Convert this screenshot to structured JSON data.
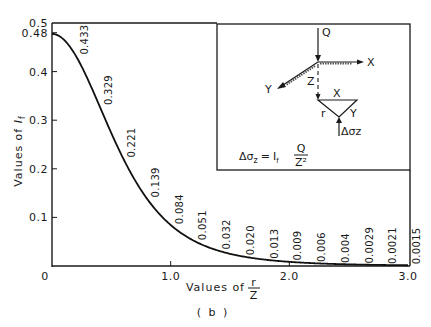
{
  "chart_data": {
    "type": "line",
    "title": "",
    "caption": "( b )",
    "xlabel": "Values of r/Z",
    "xlabel_prefix": "Values of",
    "xlabel_fraction": {
      "num": "r",
      "den": "Z"
    },
    "ylabel": "Values of If",
    "ylabel_prefix": "Values of",
    "ylabel_symbol": "I",
    "ylabel_subscript": "f",
    "xlim": [
      0,
      3.0
    ],
    "ylim": [
      0,
      0.5
    ],
    "grid": false,
    "legend": null,
    "x_ticks": [
      {
        "value": 0,
        "label": "0"
      },
      {
        "value": 1.0,
        "label": "1.0"
      },
      {
        "value": 2.0,
        "label": "2.0"
      },
      {
        "value": 3.0,
        "label": "3.0"
      }
    ],
    "y_ticks": [
      {
        "value": 0.1,
        "label": "0.1"
      },
      {
        "value": 0.2,
        "label": "0.2"
      },
      {
        "value": 0.3,
        "label": "0.3"
      },
      {
        "value": 0.4,
        "label": "0.4"
      },
      {
        "value": 0.48,
        "label": "0.48"
      },
      {
        "value": 0.5,
        "label": "0.5"
      }
    ],
    "series": [
      {
        "name": "If (Boussinesq influence factor)",
        "color": "#111111",
        "x": [
          0,
          0.2,
          0.4,
          0.6,
          0.8,
          1.0,
          1.2,
          1.4,
          1.6,
          1.8,
          2.0,
          2.2,
          2.4,
          2.6,
          2.8,
          3.0
        ],
        "y": [
          0.4775,
          0.433,
          0.329,
          0.221,
          0.139,
          0.084,
          0.051,
          0.032,
          0.02,
          0.013,
          0.009,
          0.006,
          0.004,
          0.0029,
          0.0021,
          0.0015
        ]
      }
    ],
    "annotations": [
      {
        "x": 0.2,
        "y": 0.433,
        "text": "0.433"
      },
      {
        "x": 0.4,
        "y": 0.329,
        "text": "0.329"
      },
      {
        "x": 0.6,
        "y": 0.221,
        "text": "0.221"
      },
      {
        "x": 0.8,
        "y": 0.139,
        "text": "0.139"
      },
      {
        "x": 1.0,
        "y": 0.084,
        "text": "0.084"
      },
      {
        "x": 1.2,
        "y": 0.051,
        "text": "0.051"
      },
      {
        "x": 1.4,
        "y": 0.032,
        "text": "0.032"
      },
      {
        "x": 1.6,
        "y": 0.02,
        "text": "0.020"
      },
      {
        "x": 1.8,
        "y": 0.013,
        "text": "0.013"
      },
      {
        "x": 2.0,
        "y": 0.009,
        "text": "0.009"
      },
      {
        "x": 2.2,
        "y": 0.006,
        "text": "0.006"
      },
      {
        "x": 2.4,
        "y": 0.004,
        "text": "0.004"
      },
      {
        "x": 2.6,
        "y": 0.0029,
        "text": "0.0029"
      },
      {
        "x": 2.8,
        "y": 0.0021,
        "text": "0.0021"
      },
      {
        "x": 3.0,
        "y": 0.0015,
        "text": "0.0015"
      }
    ],
    "inset": {
      "labels": {
        "load": "Q",
        "x_axis": "X",
        "y_axis": "Y",
        "depth": "Z",
        "top_x": "X",
        "radius": "r",
        "side_y": "Y",
        "stress": "Δσz"
      },
      "formula": {
        "lhs": "Δσ",
        "lhs_sub": "z",
        "eq": "=",
        "factor": "I",
        "factor_sub": "f",
        "num": "Q",
        "den": "Z²"
      }
    }
  },
  "colors": {
    "ink": "#1a1a1a",
    "background": "#ffffff"
  }
}
